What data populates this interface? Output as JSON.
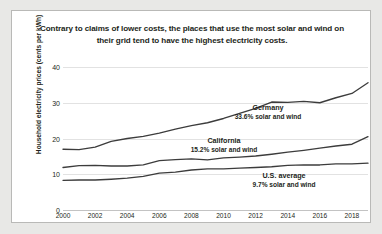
{
  "chart_data": {
    "type": "line",
    "title": "Contrary to claims of lower costs, the places that use the most solar and wind on their grid tend to have the highest electricity costs.",
    "xlabel": "",
    "ylabel": "Household electricity prices (cents per kWh)",
    "xlim": [
      2000,
      2019
    ],
    "ylim": [
      0,
      40
    ],
    "yticks": [
      0,
      10,
      20,
      30,
      40
    ],
    "ytick_labels": [
      "0",
      "10",
      "20",
      "30",
      "40"
    ],
    "xticks": [
      2000,
      2002,
      2004,
      2006,
      2008,
      2010,
      2012,
      2014,
      2016,
      2018
    ],
    "xtick_labels": [
      "2000",
      "2002",
      "2004",
      "2006",
      "2008",
      "2010",
      "2012",
      "2014",
      "2016",
      "2018"
    ],
    "grid": true,
    "legend": "annotations-inline",
    "x": [
      2000,
      2001,
      2002,
      2003,
      2004,
      2005,
      2006,
      2007,
      2008,
      2009,
      2010,
      2011,
      2012,
      2013,
      2014,
      2015,
      2016,
      2017,
      2018,
      2019
    ],
    "series": [
      {
        "name": "Germany",
        "annotation_line1": "Germany",
        "annotation_line2": "33.6% solar and wind",
        "share_solar_wind_pct": 33.6,
        "color": "#3c3c3c",
        "values": [
          17.0,
          16.9,
          17.6,
          19.2,
          20.0,
          20.6,
          21.5,
          22.6,
          23.6,
          24.4,
          25.6,
          27.0,
          28.4,
          30.2,
          30.1,
          30.4,
          30.0,
          31.4,
          32.6,
          35.6
        ]
      },
      {
        "name": "California",
        "annotation_line1": "California",
        "annotation_line2": "15.2% solar and wind",
        "share_solar_wind_pct": 15.2,
        "color": "#3c3c3c",
        "values": [
          11.9,
          12.4,
          12.5,
          12.3,
          12.3,
          12.6,
          13.8,
          14.1,
          14.3,
          14.0,
          14.6,
          14.8,
          15.1,
          15.6,
          16.2,
          16.7,
          17.3,
          17.9,
          18.4,
          20.5
        ]
      },
      {
        "name": "U.S. average",
        "annotation_line1": "U.S. average",
        "annotation_line2": "9.7% solar and wind",
        "share_solar_wind_pct": 9.7,
        "color": "#3c3c3c",
        "values": [
          8.3,
          8.4,
          8.4,
          8.6,
          8.9,
          9.4,
          10.3,
          10.6,
          11.2,
          11.5,
          11.5,
          11.7,
          11.9,
          12.1,
          12.5,
          12.6,
          12.6,
          12.9,
          12.9,
          13.1
        ]
      }
    ]
  }
}
